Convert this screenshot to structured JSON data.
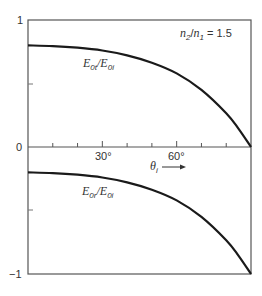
{
  "chart_data": {
    "type": "line",
    "title": "",
    "xlabel": "θi",
    "ylabel": "",
    "xlim": [
      0,
      90
    ],
    "ylim": [
      -1,
      1
    ],
    "x_ticks": [
      0,
      10,
      20,
      30,
      40,
      50,
      60,
      70,
      80,
      90
    ],
    "x_tick_labels": {
      "30": "30°",
      "60": "60°"
    },
    "y_tick_labels": [
      "1",
      "0",
      "−1"
    ],
    "y_minor_ticks": [
      0.5,
      -0.5
    ],
    "grid": false,
    "x": [
      0,
      10,
      20,
      30,
      40,
      50,
      60,
      70,
      80,
      85,
      90
    ],
    "series": [
      {
        "name": "E0t/E0i",
        "values": [
          0.8,
          0.795,
          0.782,
          0.76,
          0.722,
          0.664,
          0.58,
          0.45,
          0.266,
          0.143,
          0
        ]
      },
      {
        "name": "E0r/E0i",
        "values": [
          -0.2,
          -0.205,
          -0.218,
          -0.24,
          -0.278,
          -0.336,
          -0.42,
          -0.55,
          -0.734,
          -0.857,
          -1
        ]
      }
    ],
    "annotations": [
      "n2/n1 = 1.5",
      "θi →"
    ]
  },
  "labels": {
    "y_top": "1",
    "y_zero": "0",
    "y_bottom": "−1",
    "x_30": "30°",
    "x_60": "60°",
    "theta": "θ",
    "theta_sub": "i",
    "arrow": "⟶",
    "ratio_n2": "n",
    "ratio_n2_sub": "2",
    "ratio_slash": "/",
    "ratio_n1": "n",
    "ratio_n1_sub": "1",
    "ratio_value": " = 1.5",
    "t_E_num": "E",
    "t_sub_num": "0t",
    "t_slash": "/",
    "t_E_den": "E",
    "t_sub_den": "0i",
    "r_E_num": "E",
    "r_sub_num": "0r",
    "r_slash": "/",
    "r_E_den": "E",
    "r_sub_den": "0i"
  },
  "colors": {
    "axis": "#555555",
    "curve": "#1a1a1a"
  }
}
